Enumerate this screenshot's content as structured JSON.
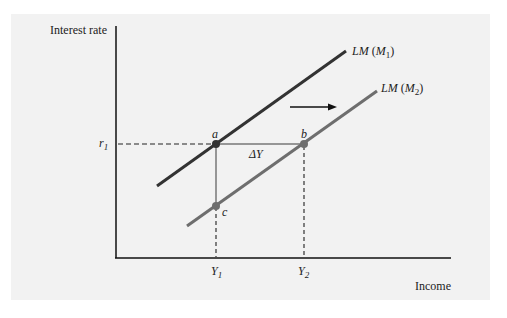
{
  "diagram": {
    "y_axis_label": "Interest rate",
    "x_axis_label": "Income",
    "r_label": "r",
    "r_sub": "1",
    "y1_label": "Y",
    "y1_sub": "1",
    "y2_label": "Y",
    "y2_sub": "2",
    "delta_label": "ΔY",
    "curves": [
      {
        "name": "LM",
        "money": "M",
        "sub": "1",
        "color": "#333333"
      },
      {
        "name": "LM",
        "money": "M",
        "sub": "2",
        "color": "#6e6e6e"
      }
    ],
    "points": {
      "a": "a",
      "b": "b",
      "c": "c"
    },
    "shift_arrow": "right"
  }
}
